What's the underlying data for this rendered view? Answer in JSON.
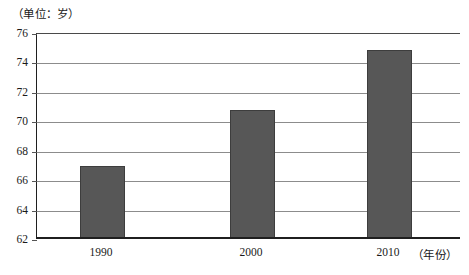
{
  "chart_data": {
    "type": "bar",
    "title": "",
    "unit_caption": "（单位：岁）",
    "xlabel": "（年份）",
    "ylabel": "",
    "categories": [
      "1990",
      "2000",
      "2010"
    ],
    "values": [
      66.9,
      70.7,
      74.8
    ],
    "ylim": [
      62,
      76
    ],
    "ytick_labels": [
      "76",
      "74",
      "72",
      "70",
      "68",
      "66",
      "64",
      "62"
    ],
    "ytick_values": [
      76,
      74,
      72,
      70,
      68,
      66,
      64,
      62
    ],
    "grid": true,
    "grid_axis": "y",
    "legend": false,
    "series": [
      {
        "name": "人均预期寿命",
        "values": [
          66.9,
          70.7,
          74.8
        ],
        "color": "#575757"
      }
    ]
  },
  "colors": {
    "bar_fill": "#575757",
    "bar_stroke": "#3d3d3d",
    "gridline": "#8c8c8c",
    "axis": "#1f1f1f",
    "text": "#1a1a1a",
    "background": "#ffffff"
  }
}
